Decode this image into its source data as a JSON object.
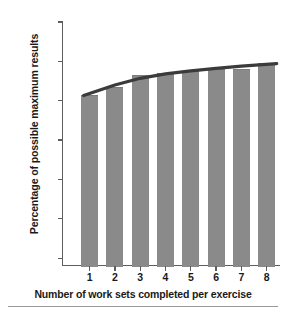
{
  "chart_data": {
    "type": "bar",
    "title": "",
    "subtitle": "",
    "xlabel": "Number of work sets completed per exercise",
    "ylabel": "Percentage of possible maximum results",
    "categories": [
      "1",
      "2",
      "3",
      "4",
      "5",
      "6",
      "7",
      "8"
    ],
    "values": [
      81.5,
      83.5,
      86.5,
      87.0,
      87.5,
      88.0,
      88.0,
      89.5
    ],
    "series": [
      {
        "name": "Percentage of possible maximum results",
        "values": [
          81.5,
          83.5,
          86.5,
          87.0,
          87.5,
          88.0,
          88.0,
          89.5
        ]
      },
      {
        "name": "trend",
        "type": "line",
        "values": [
          81.3,
          84.0,
          85.7,
          86.8,
          87.6,
          88.2,
          88.8,
          89.4
        ]
      }
    ],
    "ylim": [
      38,
      100
    ],
    "xlim": [
      0.4,
      8.6
    ],
    "grid": false,
    "legend": false,
    "legend_position": "none",
    "bar_color": "#8a8a8a",
    "line_color": "#3b3b3b",
    "axis_color": "#5d5d5d",
    "yticks": [
      {
        "value": 100,
        "label": "100%"
      },
      {
        "value": 90,
        "label": "90%"
      },
      {
        "value": 80,
        "label": "80%"
      },
      {
        "value": 70,
        "label": "70%"
      },
      {
        "value": 60,
        "label": ""
      },
      {
        "value": 50,
        "label": ""
      },
      {
        "value": 40,
        "label": ""
      }
    ],
    "ytick_labels": [
      "100%",
      "90%",
      "80%",
      "70%"
    ],
    "xtick_labels": [
      "1",
      "2",
      "3",
      "4",
      "5",
      "6",
      "7",
      "8"
    ],
    "annotations": []
  }
}
